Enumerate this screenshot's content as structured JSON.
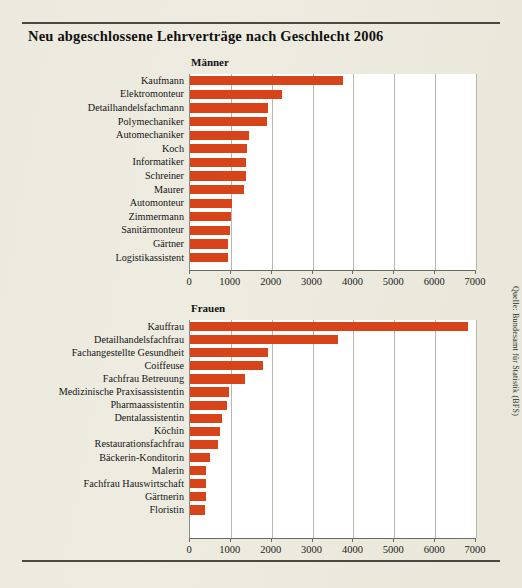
{
  "title": "Neu abgeschlossene Lehrverträge nach Geschlecht 2006",
  "source": "Quelle: Bundesamt für Statistik (BFS)",
  "chart_data": [
    {
      "type": "bar",
      "orientation": "horizontal",
      "title": "Männer",
      "xlabel": "",
      "ylabel": "",
      "xlim": [
        0,
        7000
      ],
      "xticks": [
        0,
        1000,
        2000,
        3000,
        4000,
        5000,
        6000,
        7000
      ],
      "tick_labels": [
        "0",
        "1000",
        "2000",
        "3000",
        "4000",
        "5000",
        "6000",
        "7000"
      ],
      "grid": true,
      "legend": "none",
      "bar_color": "#d8441a",
      "categories": [
        "Kaufmann",
        "Elektromonteur",
        "Detailhandelsfachmann",
        "Polymechaniker",
        "Automechaniker",
        "Koch",
        "Informatiker",
        "Schreiner",
        "Maurer",
        "Automonteur",
        "Zimmermann",
        "Sanitärmonteur",
        "Gärtner",
        "Logistikassistent"
      ],
      "values": [
        3750,
        2250,
        1900,
        1880,
        1450,
        1400,
        1380,
        1370,
        1330,
        1030,
        1000,
        980,
        930,
        920
      ]
    },
    {
      "type": "bar",
      "orientation": "horizontal",
      "title": "Frauen",
      "xlabel": "",
      "ylabel": "",
      "xlim": [
        0,
        7000
      ],
      "xticks": [
        0,
        1000,
        2000,
        3000,
        4000,
        5000,
        6000,
        7000
      ],
      "tick_labels": [
        "0",
        "1000",
        "2000",
        "3000",
        "4000",
        "5000",
        "6000",
        "7000"
      ],
      "grid": true,
      "legend": "none",
      "bar_color": "#d8441a",
      "categories": [
        "Kauffrau",
        "Detailhandelsfachfrau",
        "Fachangestellte Gesundheit",
        "Coiffeuse",
        "Fachfrau Betreuung",
        "Medizinische Praxisassistentin",
        "Pharmaassistentin",
        "Dentalassistentin",
        "Köchin",
        "Restaurationsfachfrau",
        "Bäckerin-Konditorin",
        "Malerin",
        "Fachfrau Hauswirtschaft",
        "Gärtnerin",
        "Floristin"
      ],
      "values": [
        6800,
        3620,
        1900,
        1780,
        1350,
        950,
        900,
        780,
        740,
        680,
        480,
        400,
        390,
        380,
        360
      ]
    }
  ]
}
